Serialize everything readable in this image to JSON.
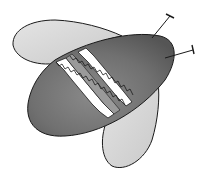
{
  "illustration": {
    "subject": "bee",
    "style": "hand-drawn grayscale watercolor",
    "colors": {
      "background": "#ffffff",
      "outline": "#1a1a1a",
      "body": "#7a7a7a",
      "body_dark": "#5e5e5e",
      "wing": "#d9d9d9",
      "stripe_light": "#ffffff",
      "stripe_mid": "#9a9a9a"
    },
    "parts": [
      "body",
      "upper-wing",
      "lower-wing",
      "stripes",
      "antenna-left",
      "antenna-right"
    ]
  }
}
